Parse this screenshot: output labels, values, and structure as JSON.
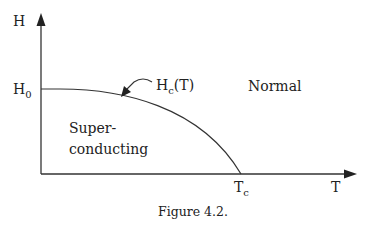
{
  "figure": {
    "caption": "Figure 4.2.",
    "y_axis_label": "H",
    "x_axis_label": "T",
    "h0_label": {
      "main": "H",
      "sub": "0"
    },
    "tc_label": {
      "main": "T",
      "sub": "c"
    },
    "curve_label": {
      "main": "H",
      "sub": "c",
      "rest": "(T)"
    },
    "region_normal": "Normal",
    "region_super_line1": "Super-",
    "region_super_line2": "conducting",
    "colors": {
      "line": "#333333",
      "text": "#222222"
    }
  }
}
